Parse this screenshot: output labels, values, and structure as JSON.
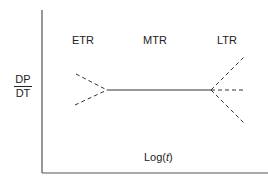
{
  "diagram": {
    "y_axis_label": {
      "numerator": "DP",
      "denominator": "DT"
    },
    "x_axis_label": {
      "prefix": "Log(",
      "var": "t",
      "suffix": ")"
    },
    "regions": [
      {
        "label": "ETR"
      },
      {
        "label": "MTR"
      },
      {
        "label": "LTR"
      }
    ],
    "lines": {
      "solid": "middle flat segment (MTR)",
      "dashed_left": [
        "upper converging",
        "lower converging"
      ],
      "dashed_right": [
        "upward diverging",
        "flat continuation",
        "downward diverging"
      ]
    },
    "colors": {
      "line": "#333333",
      "axis": "#444444"
    }
  }
}
